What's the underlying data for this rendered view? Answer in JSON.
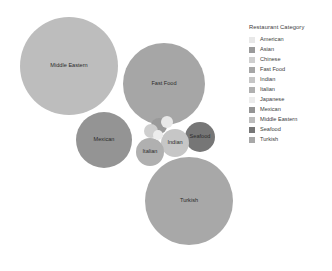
{
  "legend": {
    "title": "Restaurant Category",
    "position": "right",
    "items": [
      {
        "label": "American",
        "color": "#e8e8e8"
      },
      {
        "label": "Asian",
        "color": "#9a9a9a"
      },
      {
        "label": "Chinese",
        "color": "#cfcfcf"
      },
      {
        "label": "Fast Food",
        "color": "#a6a6a6"
      },
      {
        "label": "Indian",
        "color": "#c6c6c6"
      },
      {
        "label": "Italian",
        "color": "#b0b0b0"
      },
      {
        "label": "Japanese",
        "color": "#ececec"
      },
      {
        "label": "Mexican",
        "color": "#949494"
      },
      {
        "label": "Middle Eastern",
        "color": "#bdbdbd"
      },
      {
        "label": "Seafood",
        "color": "#767676"
      },
      {
        "label": "Turkish",
        "color": "#a8a8a8"
      }
    ]
  },
  "chart_data": {
    "type": "bubble",
    "title": "",
    "xlabel": "",
    "ylabel": "",
    "grid": false,
    "legend_title": "Restaurant Category",
    "legend_position": "right",
    "categories": [
      "American",
      "Asian",
      "Chinese",
      "Fast Food",
      "Indian",
      "Italian",
      "Japanese",
      "Mexican",
      "Middle Eastern",
      "Seafood",
      "Turkish"
    ],
    "points": [
      {
        "label": "Middle Eastern",
        "cx": 69,
        "cy": 66,
        "r": 49,
        "color": "#bdbdbd",
        "size": 49,
        "label_visible": true,
        "label_color": "#2b2b2b"
      },
      {
        "label": "Fast Food",
        "cx": 164,
        "cy": 84,
        "r": 41,
        "color": "#a6a6a6",
        "size": 41,
        "label_visible": true,
        "label_color": "#f2f2f2"
      },
      {
        "label": "Turkish",
        "cx": 189,
        "cy": 201,
        "r": 44,
        "color": "#a8a8a8",
        "size": 44,
        "label_visible": true,
        "label_color": "#2b2b2b"
      },
      {
        "label": "Mexican",
        "cx": 104,
        "cy": 140,
        "r": 28,
        "color": "#949494",
        "size": 28,
        "label_visible": true,
        "label_color": "#f2f2f2"
      },
      {
        "label": "Seafood",
        "cx": 200,
        "cy": 137,
        "r": 15,
        "color": "#767676",
        "size": 15,
        "label_visible": true,
        "label_color": "#f2f2f2"
      },
      {
        "label": "Indian",
        "cx": 175,
        "cy": 143,
        "r": 14,
        "color": "#c6c6c6",
        "size": 14,
        "label_visible": true,
        "label_color": "#2b2b2b"
      },
      {
        "label": "Italian",
        "cx": 150,
        "cy": 152,
        "r": 14,
        "color": "#b0b0b0",
        "size": 14,
        "label_visible": true,
        "label_color": "#2b2b2b"
      },
      {
        "label": "Asian",
        "cx": 159,
        "cy": 126,
        "r": 8,
        "color": "#9a9a9a",
        "size": 8,
        "label_visible": false,
        "label_color": "#2b2b2b"
      },
      {
        "label": "Chinese",
        "cx": 151,
        "cy": 131,
        "r": 7,
        "color": "#cfcfcf",
        "size": 7,
        "label_visible": false,
        "label_color": "#2b2b2b"
      },
      {
        "label": "American",
        "cx": 167,
        "cy": 122,
        "r": 6,
        "color": "#e8e8e8",
        "size": 6,
        "label_visible": false,
        "label_color": "#2b2b2b"
      },
      {
        "label": "Japanese",
        "cx": 158,
        "cy": 135,
        "r": 5,
        "color": "#ececec",
        "size": 5,
        "label_visible": false,
        "label_color": "#2b2b2b"
      }
    ]
  }
}
